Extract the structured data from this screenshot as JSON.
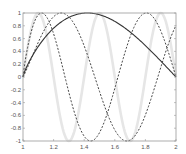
{
  "chart_data": {
    "type": "line",
    "title": "",
    "xlabel": "",
    "ylabel": "",
    "xlim": [
      1,
      2
    ],
    "ylim": [
      -1,
      1
    ],
    "grid": false,
    "legend": null,
    "x_ticks": [
      "1",
      "1.2",
      "1.4",
      "1.6",
      "1.8",
      "2"
    ],
    "y_ticks": [
      "-1",
      "-0.8",
      "-0.6",
      "-0.4",
      "-0.2",
      "0",
      "0.2",
      "0.4",
      "0.6",
      "0.8",
      "1"
    ],
    "x": [
      1.0,
      1.1,
      1.2,
      1.3,
      1.4,
      1.5,
      1.6,
      1.7,
      1.8,
      1.9,
      2.0
    ],
    "series": [
      {
        "name": "light-thick",
        "style": "solid",
        "color": "#e6e6e6",
        "width": 2.6,
        "model": {
          "a": 15.708,
          "p": 1.0
        },
        "values": [
          0,
          1,
          0,
          -1,
          0,
          1,
          0,
          -1,
          0,
          1,
          0
        ]
      },
      {
        "name": "dashed-a",
        "style": "dashed",
        "color": "#444444",
        "width": 1.0,
        "model": {
          "a": 9.425,
          "p": 0.85
        },
        "values": [
          0,
          0.971,
          0.673,
          -0.24,
          -0.927,
          -0.868,
          -0.176,
          0.624,
          0.999,
          0.725,
          0
        ]
      },
      {
        "name": "dashed-b",
        "style": "dashed",
        "color": "#444444",
        "width": 1.0,
        "model": {
          "a": 7.22,
          "p": 1.1
        },
        "values": [
          0,
          0.542,
          0.941,
          0.94,
          0.485,
          -0.228,
          -0.827,
          -0.987,
          -0.599,
          0.141,
          0.804
        ]
      },
      {
        "name": "solid-dark",
        "style": "solid",
        "color": "#333333",
        "width": 1.1,
        "model": {
          "a": 3.1416,
          "p": 0.8
        },
        "values": [
          0,
          0.482,
          0.763,
          0.93,
          0.998,
          0.971,
          0.865,
          0.697,
          0.489,
          0.253,
          0
        ]
      }
    ]
  }
}
